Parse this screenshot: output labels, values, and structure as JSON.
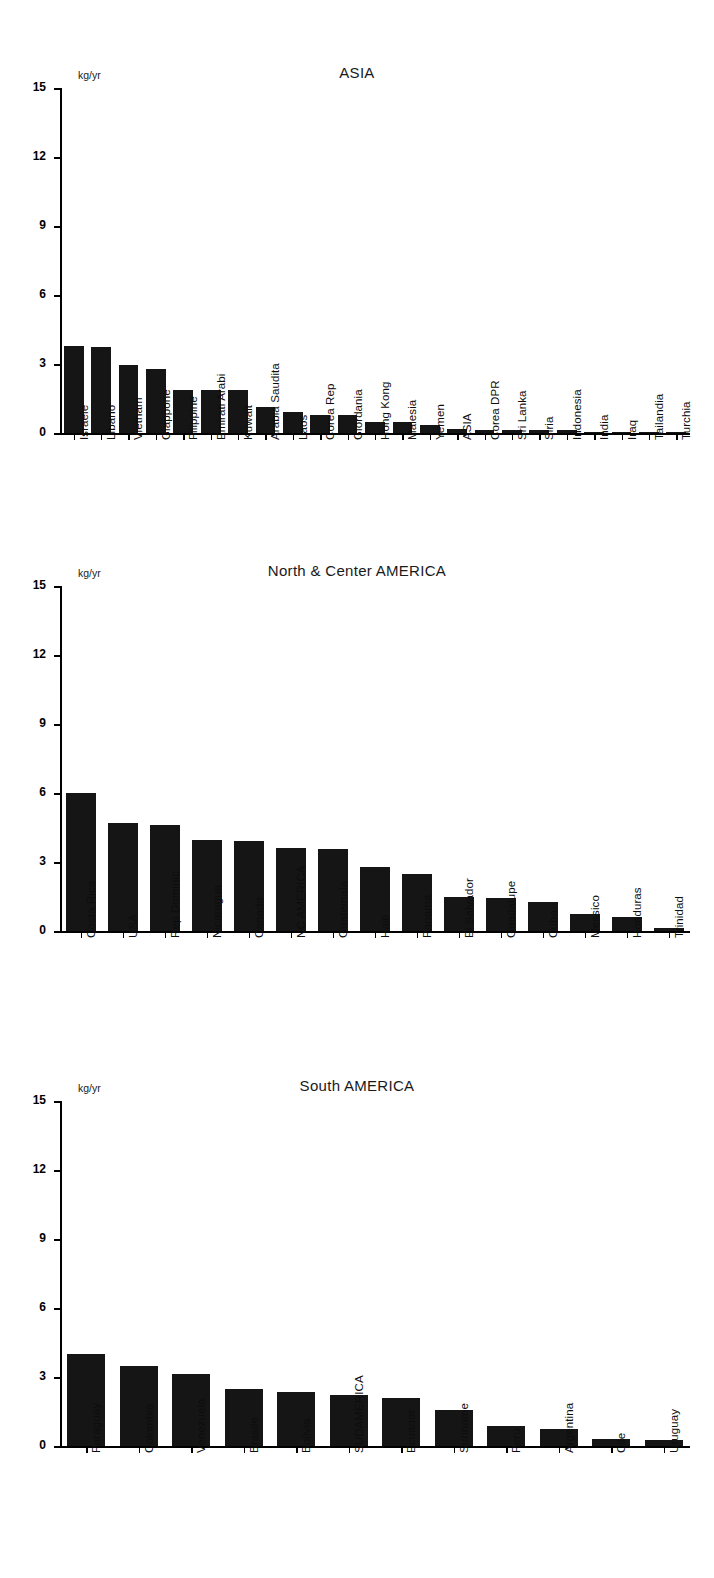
{
  "figure": {
    "unit_label": "kg/yr",
    "y_ticks": [
      "0",
      "3",
      "6",
      "9",
      "12",
      "15"
    ]
  },
  "chart_data": [
    {
      "type": "bar",
      "title": "ASIA",
      "ylabel": "kg/yr",
      "xlabel": "",
      "ylim": [
        0,
        15
      ],
      "yticks": [
        0,
        3,
        6,
        9,
        12,
        15
      ],
      "grid": false,
      "legend": "none",
      "categories": [
        "Israele",
        "Libano",
        "Vietnam",
        "Giappone",
        "Filippine",
        "Emirati Arabi",
        "Kuwait",
        "Arabia Saudita",
        "Laos",
        "Corea Rep",
        "Giordania",
        "Hong Kong",
        "Malesia",
        "Yemen",
        "ASIA",
        "Corea DPR",
        "Sri Lanka",
        "Siria",
        "Indonesia",
        "India",
        "Iraq",
        "Tailandia",
        "Turchia"
      ],
      "values": [
        3.8,
        3.75,
        2.95,
        2.8,
        1.85,
        1.85,
        1.85,
        1.15,
        0.9,
        0.8,
        0.78,
        0.5,
        0.47,
        0.33,
        0.18,
        0.15,
        0.14,
        0.13,
        0.12,
        0.05,
        0.04,
        0.03,
        0.02
      ]
    },
    {
      "type": "bar",
      "title": "North & Center AMERICA",
      "ylabel": "kg/yr",
      "xlabel": "",
      "ylim": [
        0,
        15
      ],
      "yticks": [
        0,
        3,
        6,
        9,
        12,
        15
      ],
      "grid": false,
      "legend": "none",
      "categories": [
        "Costa Rica",
        "USA",
        "Rep Dominic",
        "Nicaragua",
        "Canada",
        "NC AMERICA",
        "Guatemala",
        "Haiti",
        "Panama",
        "El Salvador",
        "Guadalupe",
        "Cuba",
        "Messico",
        "Honduras",
        "Trinidad"
      ],
      "values": [
        6.0,
        4.7,
        4.6,
        3.95,
        3.9,
        3.6,
        3.55,
        2.8,
        2.5,
        1.5,
        1.42,
        1.25,
        0.72,
        0.6,
        0.15
      ]
    },
    {
      "type": "bar",
      "title": "South AMERICA",
      "ylabel": "kg/yr",
      "xlabel": "",
      "ylim": [
        0,
        15
      ],
      "yticks": [
        0,
        3,
        6,
        9,
        12,
        15
      ],
      "grid": false,
      "legend": "none",
      "categories": [
        "Paraguay",
        "Colombia",
        "Venezuela",
        "Brasile",
        "Bolivia",
        "SUDAMERICA",
        "Ecuador",
        "Suriname",
        "Perù",
        "Argentina",
        "Cile",
        "Uruguay"
      ],
      "values": [
        4.0,
        3.5,
        3.15,
        2.5,
        2.35,
        2.2,
        2.1,
        1.55,
        0.85,
        0.75,
        0.3,
        0.28
      ]
    }
  ]
}
